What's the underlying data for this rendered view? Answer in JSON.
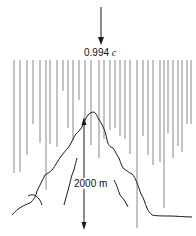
{
  "diagram": {
    "speed_label": {
      "value": "0.994",
      "unit": "c"
    },
    "height_label": "2000 m",
    "colors": {
      "line": "#1a1a1a",
      "rain": "#555555",
      "background": "#ffffff"
    },
    "rain_lines": [
      [
        14,
        60,
        173
      ],
      [
        20,
        60,
        172
      ],
      [
        27,
        60,
        155
      ],
      [
        33,
        60,
        124
      ],
      [
        40,
        60,
        143
      ],
      [
        46,
        60,
        190
      ],
      [
        50,
        60,
        144
      ],
      [
        57,
        60,
        147
      ],
      [
        63,
        60,
        91
      ],
      [
        68,
        60,
        128
      ],
      [
        73,
        60,
        140
      ],
      [
        79,
        60,
        100
      ],
      [
        85,
        60,
        118
      ],
      [
        91,
        60,
        145
      ],
      [
        99,
        60,
        158
      ],
      [
        104,
        60,
        139
      ],
      [
        110,
        60,
        130
      ],
      [
        115,
        60,
        128
      ],
      [
        120,
        60,
        136
      ],
      [
        125,
        60,
        139
      ],
      [
        130,
        60,
        154
      ],
      [
        137,
        60,
        228
      ],
      [
        143,
        60,
        136
      ],
      [
        148,
        60,
        155
      ],
      [
        153,
        60,
        165
      ],
      [
        160,
        60,
        162
      ],
      [
        164,
        60,
        208
      ],
      [
        168,
        60,
        133
      ],
      [
        173,
        60,
        158
      ],
      [
        178,
        60,
        146
      ],
      [
        182,
        60,
        152
      ],
      [
        187,
        60,
        124
      ],
      [
        191,
        60,
        124
      ]
    ]
  }
}
